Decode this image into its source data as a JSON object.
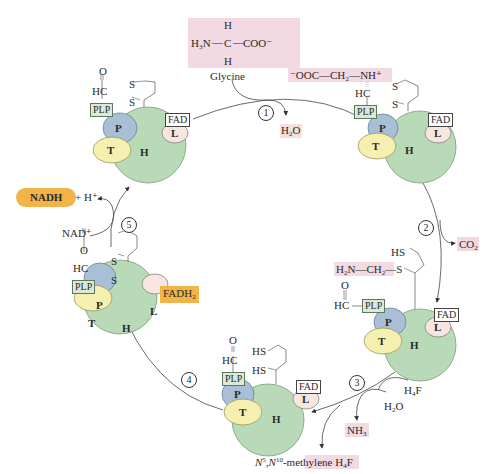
{
  "colors": {
    "H_protein": "#b9dab7",
    "P_protein": "#a8bfd6",
    "T_protein": "#f6f0b0",
    "L_protein": "#f6e6df",
    "highlight_pink": "#f3d9e1",
    "highlight_orange": "#f2b347",
    "plp_box": "#dbead8"
  },
  "proteins": {
    "H": "H",
    "P": "P",
    "T": "T",
    "L": "L"
  },
  "cofactors": {
    "plp": "PLP",
    "fad": "FAD",
    "fadh2": "FADH",
    "fadh2_sub": "2"
  },
  "substrate": {
    "glycine_label": "Glycine",
    "glycine_formula": {
      "h_top": "H",
      "h_bottom": "H",
      "n": "H₃N",
      "c": "C",
      "coo": "COO⁻"
    }
  },
  "intermediates": {
    "schiff_base": "⁻OOC—CH₂—NH⁺",
    "hc": "HC",
    "o": "O",
    "aminomethyl": "H₂N—CH₂—S",
    "hs": "HS",
    "s": "S"
  },
  "steps": [
    {
      "num": "1",
      "product": "H₂O"
    },
    {
      "num": "2",
      "product": "CO₂"
    },
    {
      "num": "3",
      "inputs": [
        "H₄F",
        "H₂O"
      ],
      "products": [
        "NH₃",
        "N⁵,N¹⁰-methylene H₄F"
      ]
    },
    {
      "num": "4"
    },
    {
      "num": "5",
      "input": "NAD⁺",
      "products": [
        "NADH",
        "+ H⁺"
      ]
    }
  ],
  "labels": {
    "nadh": "NADH",
    "h_plus": "+ H⁺",
    "nad_plus": "NAD⁺",
    "h4f": "H₄F",
    "h2o": "H₂O",
    "nh3": "NH₃",
    "co2": "CO₂",
    "methylene_prefix": "N⁵,N¹⁰-",
    "methylene_mid": "methylene",
    "methylene_suffix": " H₄F"
  }
}
